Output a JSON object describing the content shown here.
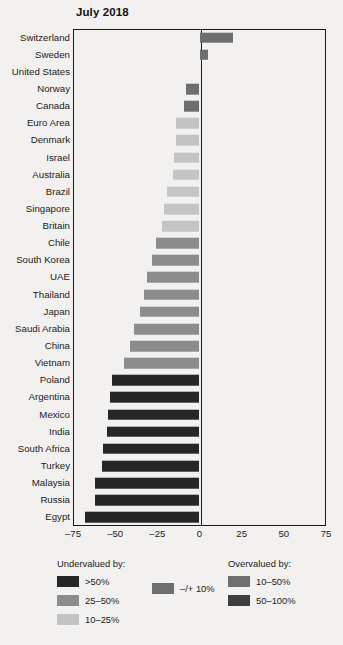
{
  "chart_data": {
    "type": "bar",
    "orientation": "horizontal",
    "title": "July 2018",
    "xlabel": "",
    "ylabel": "",
    "xlim": [
      -75,
      75
    ],
    "xticks": [
      "–75",
      "–50",
      "–25",
      "0",
      "25",
      "50",
      "75"
    ],
    "xtick_values": [
      -75,
      -50,
      -25,
      0,
      25,
      50,
      75
    ],
    "grid": false,
    "legend_position": "bottom",
    "categories": [
      "Switzerland",
      "Sweden",
      "United States",
      "Norway",
      "Canada",
      "Euro Area",
      "Denmark",
      "Israel",
      "Australia",
      "Brazil",
      "Singapore",
      "Britain",
      "Chile",
      "South Korea",
      "UAE",
      "Thailand",
      "Japan",
      "Saudi Arabia",
      "China",
      "Vietnam",
      "Poland",
      "Argentina",
      "Mexico",
      "India",
      "South Africa",
      "Turkey",
      "Malaysia",
      "Russia",
      "Egypt"
    ],
    "values": [
      20,
      5,
      0,
      -8,
      -9,
      -14,
      -14,
      -15,
      -16,
      -19,
      -21,
      -22,
      -26,
      -28,
      -31,
      -33,
      -35,
      -39,
      -41,
      -45,
      -52,
      -53,
      -54,
      -55,
      -57,
      -58,
      -62,
      -62,
      -68
    ],
    "bands": [
      "over_10_50",
      "mid",
      "mid",
      "mid",
      "mid",
      "under_10_25",
      "under_10_25",
      "under_10_25",
      "under_10_25",
      "under_10_25",
      "under_10_25",
      "under_10_25",
      "under_25_50",
      "under_25_50",
      "under_25_50",
      "under_25_50",
      "under_25_50",
      "under_25_50",
      "under_25_50",
      "under_25_50",
      "under_over_50",
      "under_over_50",
      "under_over_50",
      "under_over_50",
      "under_over_50",
      "under_over_50",
      "under_over_50",
      "under_over_50",
      "under_over_50"
    ]
  },
  "colors": {
    "under_over_50": "#262626",
    "under_25_50": "#8c8c8c",
    "under_10_25": "#c4c4c4",
    "mid": "#6e6e6e",
    "over_10_50": "#6e6e6e",
    "over_50_100": "#3e3e3e",
    "axis": "#1a1a1a",
    "background": "#f2f1ef",
    "text": "#1b1b1b"
  },
  "legend": {
    "undervalued": {
      "heading": "Undervalued by:",
      "items": [
        {
          "label": ">50%",
          "color_key": "under_over_50"
        },
        {
          "label": "25–50%",
          "color_key": "under_25_50"
        },
        {
          "label": "10–25%",
          "color_key": "under_10_25"
        }
      ]
    },
    "middle": {
      "heading": "",
      "items": [
        {
          "label": "–/+ 10%",
          "color_key": "mid"
        }
      ]
    },
    "overvalued": {
      "heading": "Overvalued by:",
      "items": [
        {
          "label": "10–50%",
          "color_key": "over_10_50"
        },
        {
          "label": "50–100%",
          "color_key": "over_50_100"
        }
      ]
    }
  }
}
